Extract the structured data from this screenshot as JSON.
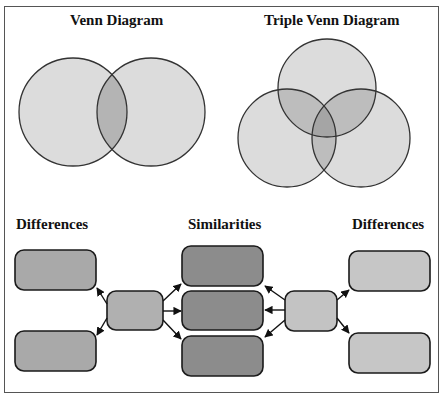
{
  "top_caption": "",
  "venn": {
    "title": "Venn Diagram",
    "circles": [
      {
        "cx": 73,
        "cy": 112,
        "r": 54
      },
      {
        "cx": 151,
        "cy": 112,
        "r": 54
      }
    ]
  },
  "triple_venn": {
    "title": "Triple Venn Diagram",
    "circles": [
      {
        "cx": 327,
        "cy": 88,
        "r": 49
      },
      {
        "cx": 287,
        "cy": 138,
        "r": 49
      },
      {
        "cx": 361,
        "cy": 138,
        "r": 49
      }
    ]
  },
  "compare_contrast": {
    "left_heading": "Differences",
    "center_heading": "Similarities",
    "right_heading": "Differences"
  },
  "colors": {
    "frame_border": "#555555",
    "circle_fill": "#dcdcdc",
    "circle_overlap": "#b4b4b4",
    "circle_stroke": "#333333",
    "left_boxes": "#a9a9a9",
    "center_boxes": "#8c8c8c",
    "right_boxes": "#c6c6c6",
    "hub_left": "#b0b0b0",
    "hub_right": "#c3c3c3",
    "box_stroke": "#1a1a1a"
  }
}
